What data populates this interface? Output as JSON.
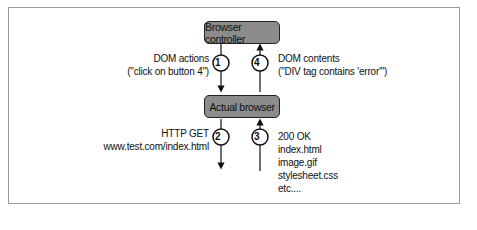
{
  "diagram": {
    "nodes": [
      {
        "id": "controller",
        "label": "Browser controller"
      },
      {
        "id": "browser",
        "label": "Actual browser"
      }
    ],
    "steps": [
      {
        "number": "1",
        "direction": "down",
        "from": "controller",
        "to": "browser",
        "label_line1": "DOM actions",
        "label_line2": "(\"click on button 4\")"
      },
      {
        "number": "4",
        "direction": "up",
        "from": "browser",
        "to": "controller",
        "label_line1": "DOM contents",
        "label_line2": "(\"DIV tag contains 'error'\")"
      },
      {
        "number": "2",
        "direction": "down",
        "from": "browser",
        "to": "web",
        "label_line1": "HTTP GET",
        "label_line2": "www.test.com/index.html"
      },
      {
        "number": "3",
        "direction": "up",
        "from": "web",
        "to": "browser",
        "lines": [
          "200 OK",
          "index.html",
          "image.gif",
          "stylesheet.css",
          "etc...."
        ]
      }
    ]
  },
  "colors": {
    "box_fill": "#8c8c8c",
    "box_border": "#222222",
    "frame_border": "#9a9a9a"
  }
}
